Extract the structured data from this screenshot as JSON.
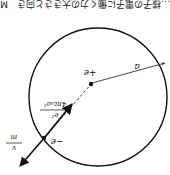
{
  "figure": {
    "orientation": "rotated-180",
    "caption_fragment": "…様子の電子に働く力の大きさと向き　M",
    "circle": {
      "cx": 98,
      "cy": 96,
      "r": 70,
      "stroke": "#111111"
    },
    "nucleus": {
      "x": 92,
      "y": 83,
      "label": "+e"
    },
    "electron": {
      "x": 43,
      "y": 138,
      "label": "−e"
    },
    "radius": {
      "label": "a"
    },
    "force_label": {
      "numerator": "e²",
      "denominator": "4πε₀a²"
    },
    "velocity_label": {
      "numerator": "v",
      "denominator": "m"
    },
    "colors": {
      "ink": "#111111",
      "background": "#ffffff"
    }
  }
}
